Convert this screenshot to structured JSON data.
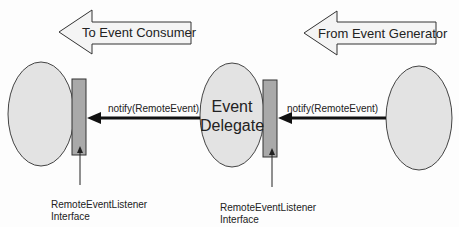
{
  "diagram": {
    "top_arrows": {
      "left": {
        "label": "To Event Consumer"
      },
      "right": {
        "label": "From Event Generator"
      }
    },
    "nodes": {
      "consumer": {
        "label": ""
      },
      "delegate": {
        "line1": "Event",
        "line2": "Delegate"
      },
      "generator": {
        "label": ""
      }
    },
    "messages": {
      "left": {
        "label": "notify(RemoteEvent)"
      },
      "right": {
        "label": "notify(RemoteEvent)"
      }
    },
    "interfaces": {
      "left": {
        "line1": "RemoteEventListener",
        "line2": "Interface"
      },
      "right": {
        "line1": "RemoteEventListener",
        "line2": "Interface"
      }
    },
    "colors": {
      "ellipse_fill": "#e3e3e3",
      "bar_fill": "#a9a9a9",
      "arrow_fill": "#f4f4f4",
      "stroke": "#333333"
    }
  }
}
